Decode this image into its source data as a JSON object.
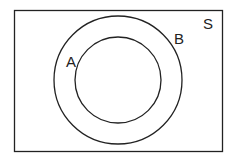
{
  "diagram": {
    "type": "venn",
    "universe_label": "S",
    "sets": [
      {
        "label": "A",
        "role": "inner circle (subset of B)"
      },
      {
        "label": "B",
        "role": "outer circle"
      }
    ],
    "relationship": "A ⊂ B ⊂ S",
    "stroke_color": "#222222",
    "background_color": "#ffffff"
  }
}
